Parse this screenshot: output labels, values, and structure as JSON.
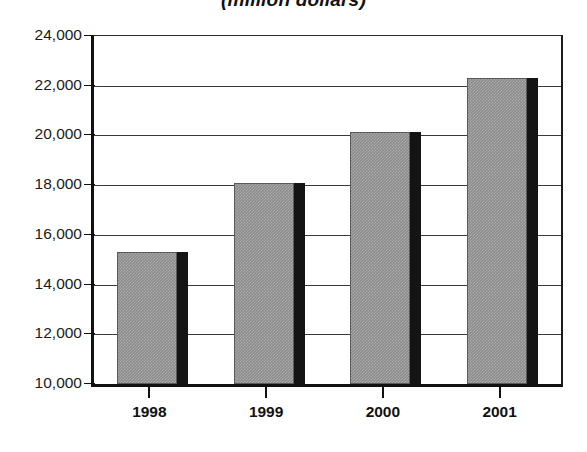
{
  "chart_data": {
    "type": "bar",
    "title": "(million dollars)",
    "xlabel": "",
    "ylabel": "",
    "categories": [
      "1998",
      "1999",
      "2000",
      "2001"
    ],
    "values": [
      15300,
      18100,
      20150,
      22300
    ],
    "series": [
      {
        "name": "",
        "values": [
          15300,
          18100,
          20150,
          22300
        ]
      }
    ],
    "ylim": [
      10000,
      24000
    ],
    "ytick_values": [
      24000,
      22000,
      20000,
      18000,
      16000,
      14000,
      12000,
      10000
    ],
    "ytick_labels": [
      "24,000",
      "22,000",
      "20,000",
      "18,000",
      "16,000",
      "14,000",
      "12,000",
      "10,000"
    ],
    "grid": true,
    "legend": null,
    "legend_position": "none",
    "bar_fill_color": "#8d8d8d",
    "bar_shadow_color": "#141414",
    "axis_color": "#111111",
    "gridline_color": "#3a3a3a",
    "background_color": "#ffffff",
    "annotations": []
  }
}
